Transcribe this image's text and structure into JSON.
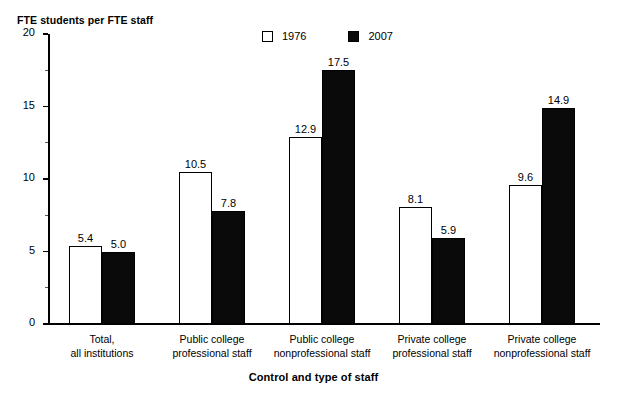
{
  "figure": {
    "caption_fragment": "1976 and 2007",
    "y_axis_title": "FTE students per FTE staff",
    "x_axis_title": "Control and type of staff"
  },
  "legend": {
    "entries": [
      {
        "label": "1976",
        "swatch": "white-square-icon",
        "color": "#ffffff"
      },
      {
        "label": "2007",
        "swatch": "black-square-icon",
        "color": "#0a0a0a"
      }
    ]
  },
  "y_ticks": [
    {
      "label": "20",
      "value": 20
    },
    {
      "label": "15",
      "value": 15
    },
    {
      "label": "10",
      "value": 10
    },
    {
      "label": "5",
      "value": 5
    },
    {
      "label": "0",
      "value": 0
    }
  ],
  "chart_data": {
    "type": "bar",
    "title": "1976 and 2007",
    "xlabel": "Control and type of staff",
    "ylabel": "FTE students per FTE staff",
    "ylim": [
      0,
      20
    ],
    "ytick_values": [
      0,
      5,
      10,
      15,
      20
    ],
    "yminor_tick_values": [
      2.5,
      7.5,
      12.5,
      17.5
    ],
    "grid": false,
    "legend_position": "top-center",
    "categories": [
      "Total,\nall institutions",
      "Public college\nprofessional staff",
      "Public college\nnonprofessional staff",
      "Private college\nprofessional staff",
      "Private college\nnonprofessional staff"
    ],
    "category_lines": [
      [
        "Total,",
        "all institutions"
      ],
      [
        "Public college",
        "professional staff"
      ],
      [
        "Public college",
        "nonprofessional staff"
      ],
      [
        "Private college",
        "professional staff"
      ],
      [
        "Private college",
        "nonprofessional staff"
      ]
    ],
    "series": [
      {
        "name": "1976",
        "color": "#ffffff",
        "values": [
          5.4,
          10.5,
          12.9,
          8.1,
          9.6
        ],
        "labels": [
          "5.4",
          "10.5",
          "12.9",
          "8.1",
          "9.6"
        ]
      },
      {
        "name": "2007",
        "color": "#0a0a0a",
        "values": [
          5.0,
          7.8,
          17.5,
          5.9,
          14.9
        ],
        "labels": [
          "5.0",
          "7.8",
          "17.5",
          "5.9",
          "14.9"
        ]
      }
    ]
  }
}
